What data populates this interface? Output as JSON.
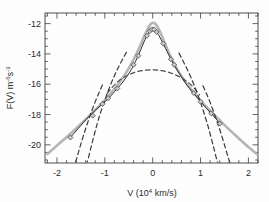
{
  "figure": {
    "name": "velocity-distribution-plot",
    "background_color": "#fdfdfd"
  },
  "chart_data": {
    "type": "line",
    "title": "",
    "xlabel": "V (10⁴ km/s)",
    "ylabel": "F(V) m⁻⁶s⁻³",
    "xlabel_parts": {
      "prefix": "V (10",
      "exponent": "4",
      "suffix": " km/s)"
    },
    "ylabel_parts": {
      "prefix": "F(V) m",
      "exp1": "-6",
      "mid": "s",
      "exp2": "-3"
    },
    "xlim": [
      -2.25,
      2.2
    ],
    "ylim": [
      -21.2,
      -11.3
    ],
    "xticks": [
      -2,
      -1,
      0,
      1,
      2
    ],
    "xtick_labels": [
      "-2",
      "-1",
      "0",
      "1",
      "2"
    ],
    "yticks": [
      -20,
      -18,
      -16,
      -14,
      -12
    ],
    "ytick_labels": [
      "-20",
      "-18",
      "-16",
      "-14",
      "-12"
    ],
    "x_minor_per_major": 5,
    "y_minor_per_major": 4,
    "grid": false,
    "legend": null,
    "frame": true,
    "ticks_inward": true,
    "series": [
      {
        "name": "model-fit-thick-gray",
        "style": "solid",
        "color": "#b5b5b5",
        "width": 2.6,
        "points": [
          [
            -2.2,
            -20.6
          ],
          [
            -2.0,
            -20.05
          ],
          [
            -1.8,
            -19.5
          ],
          [
            -1.6,
            -18.92
          ],
          [
            -1.4,
            -18.32
          ],
          [
            -1.2,
            -17.7
          ],
          [
            -1.0,
            -17.05
          ],
          [
            -0.85,
            -16.5
          ],
          [
            -0.7,
            -15.9
          ],
          [
            -0.6,
            -15.45
          ],
          [
            -0.5,
            -14.95
          ],
          [
            -0.42,
            -14.5
          ],
          [
            -0.34,
            -14.0
          ],
          [
            -0.26,
            -13.45
          ],
          [
            -0.2,
            -13.0
          ],
          [
            -0.14,
            -12.58
          ],
          [
            -0.09,
            -12.25
          ],
          [
            -0.05,
            -12.05
          ],
          [
            0.0,
            -11.95
          ],
          [
            0.05,
            -12.0
          ],
          [
            0.1,
            -12.2
          ],
          [
            0.15,
            -12.52
          ],
          [
            0.21,
            -12.95
          ],
          [
            0.27,
            -13.42
          ],
          [
            0.34,
            -13.95
          ],
          [
            0.42,
            -14.48
          ],
          [
            0.5,
            -14.95
          ],
          [
            0.6,
            -15.45
          ],
          [
            0.72,
            -16.0
          ],
          [
            0.86,
            -16.55
          ],
          [
            1.0,
            -17.08
          ],
          [
            1.2,
            -17.75
          ],
          [
            1.4,
            -18.38
          ],
          [
            1.6,
            -19.0
          ],
          [
            1.8,
            -19.58
          ],
          [
            2.0,
            -20.15
          ],
          [
            2.18,
            -20.62
          ]
        ]
      },
      {
        "name": "observed-data-black",
        "style": "solid",
        "color": "#2a2a2a",
        "width": 1.0,
        "points": [
          [
            -1.72,
            -19.52
          ],
          [
            -1.62,
            -19.15
          ],
          [
            -1.5,
            -18.72
          ],
          [
            -1.4,
            -18.35
          ],
          [
            -1.3,
            -18.05
          ],
          [
            -1.22,
            -17.78
          ],
          [
            -1.12,
            -17.5
          ],
          [
            -1.05,
            -17.3
          ],
          [
            -0.98,
            -17.1
          ],
          [
            -0.92,
            -16.92
          ],
          [
            -0.86,
            -16.72
          ],
          [
            -0.8,
            -16.5
          ],
          [
            -0.72,
            -16.22
          ],
          [
            -0.64,
            -15.92
          ],
          [
            -0.56,
            -15.58
          ],
          [
            -0.48,
            -15.2
          ],
          [
            -0.42,
            -14.88
          ],
          [
            -0.36,
            -14.5
          ],
          [
            -0.3,
            -14.1
          ],
          [
            -0.25,
            -13.72
          ],
          [
            -0.2,
            -13.35
          ],
          [
            -0.16,
            -13.05
          ],
          [
            -0.12,
            -12.8
          ],
          [
            -0.09,
            -12.62
          ],
          [
            -0.06,
            -12.48
          ],
          [
            -0.03,
            -12.38
          ],
          [
            0.0,
            -12.33
          ],
          [
            0.03,
            -12.36
          ],
          [
            0.06,
            -12.45
          ],
          [
            0.09,
            -12.58
          ],
          [
            0.13,
            -12.78
          ],
          [
            0.17,
            -13.02
          ],
          [
            0.22,
            -13.32
          ],
          [
            0.27,
            -13.65
          ],
          [
            0.33,
            -14.02
          ],
          [
            0.4,
            -14.45
          ],
          [
            0.48,
            -14.9
          ],
          [
            0.56,
            -15.32
          ],
          [
            0.64,
            -15.72
          ],
          [
            0.72,
            -16.08
          ],
          [
            0.82,
            -16.48
          ],
          [
            0.92,
            -16.85
          ],
          [
            1.02,
            -17.22
          ],
          [
            1.12,
            -17.58
          ],
          [
            1.22,
            -17.92
          ],
          [
            1.32,
            -18.28
          ],
          [
            1.42,
            -18.62
          ]
        ]
      },
      {
        "name": "gaussian-broad-dashed",
        "style": "dashed",
        "color": "#4a4a4a",
        "width": 1.2,
        "peak": [
          0.0,
          -15.05
        ],
        "points": [
          [
            -0.95,
            -16.6
          ],
          [
            -0.86,
            -16.25
          ],
          [
            -0.78,
            -15.98
          ],
          [
            -0.7,
            -15.75
          ],
          [
            -0.62,
            -15.58
          ],
          [
            -0.54,
            -15.44
          ],
          [
            -0.46,
            -15.32
          ],
          [
            -0.38,
            -15.22
          ],
          [
            -0.3,
            -15.15
          ],
          [
            -0.22,
            -15.1
          ],
          [
            -0.14,
            -15.07
          ],
          [
            -0.06,
            -15.05
          ],
          [
            0.02,
            -15.05
          ],
          [
            0.1,
            -15.07
          ],
          [
            0.18,
            -15.1
          ],
          [
            0.26,
            -15.15
          ],
          [
            0.34,
            -15.22
          ],
          [
            0.42,
            -15.31
          ],
          [
            0.5,
            -15.42
          ],
          [
            0.58,
            -15.55
          ],
          [
            0.66,
            -15.7
          ],
          [
            0.74,
            -15.88
          ],
          [
            0.82,
            -16.1
          ],
          [
            0.9,
            -16.38
          ],
          [
            0.98,
            -16.7
          ]
        ]
      },
      {
        "name": "gaussian-narrow-left-dashed",
        "style": "dashed",
        "color": "#3a3a3a",
        "width": 1.2,
        "points": [
          [
            -0.55,
            -13.9
          ],
          [
            -0.62,
            -14.3
          ],
          [
            -0.7,
            -14.78
          ],
          [
            -0.78,
            -15.3
          ],
          [
            -0.86,
            -15.88
          ],
          [
            -0.94,
            -16.52
          ],
          [
            -1.02,
            -17.22
          ],
          [
            -1.1,
            -17.98
          ],
          [
            -1.16,
            -18.62
          ],
          [
            -1.22,
            -19.32
          ],
          [
            -1.28,
            -20.05
          ],
          [
            -1.33,
            -20.7
          ],
          [
            -1.37,
            -21.15
          ]
        ]
      },
      {
        "name": "gaussian-narrow-left2-dashed",
        "style": "dashed",
        "color": "#3a3a3a",
        "width": 1.2,
        "points": [
          [
            -1.05,
            -16.05
          ],
          [
            -1.12,
            -16.55
          ],
          [
            -1.2,
            -17.15
          ],
          [
            -1.28,
            -17.82
          ],
          [
            -1.36,
            -18.55
          ],
          [
            -1.44,
            -19.32
          ],
          [
            -1.52,
            -20.15
          ],
          [
            -1.58,
            -20.82
          ],
          [
            -1.62,
            -21.2
          ]
        ]
      },
      {
        "name": "gaussian-narrow-right-dashed",
        "style": "dashed",
        "color": "#3a3a3a",
        "width": 1.2,
        "points": [
          [
            0.55,
            -13.95
          ],
          [
            0.62,
            -14.38
          ],
          [
            0.7,
            -14.88
          ],
          [
            0.78,
            -15.42
          ],
          [
            0.86,
            -16.02
          ],
          [
            0.94,
            -16.68
          ],
          [
            1.02,
            -17.4
          ],
          [
            1.1,
            -18.18
          ],
          [
            1.16,
            -18.82
          ],
          [
            1.22,
            -19.52
          ],
          [
            1.28,
            -20.25
          ],
          [
            1.33,
            -20.88
          ],
          [
            1.36,
            -21.2
          ]
        ]
      },
      {
        "name": "gaussian-narrow-right2-dashed",
        "style": "dashed",
        "color": "#3a3a3a",
        "width": 1.2,
        "points": [
          [
            1.05,
            -16.1
          ],
          [
            1.12,
            -16.6
          ],
          [
            1.2,
            -17.2
          ],
          [
            1.28,
            -17.88
          ],
          [
            1.36,
            -18.6
          ],
          [
            1.44,
            -19.38
          ],
          [
            1.52,
            -20.22
          ],
          [
            1.58,
            -20.88
          ],
          [
            1.62,
            -21.2
          ]
        ]
      }
    ],
    "markers": {
      "name": "data-point-markers",
      "shape": "diamond",
      "fill": "#c9c9c9",
      "stroke": "#4a4a4a",
      "size": 5.0,
      "points": [
        [
          -1.72,
          -19.52
        ],
        [
          -1.25,
          -18.08
        ],
        [
          -1.05,
          -17.3
        ],
        [
          -0.93,
          -16.92
        ],
        [
          -0.74,
          -16.28
        ],
        [
          -0.4,
          -14.72
        ],
        [
          -0.3,
          -14.12
        ],
        [
          -0.12,
          -12.8
        ],
        [
          -0.06,
          -12.5
        ],
        [
          -0.02,
          -12.38
        ],
        [
          0.03,
          -12.38
        ],
        [
          0.08,
          -12.55
        ],
        [
          0.22,
          -13.32
        ],
        [
          0.38,
          -14.35
        ],
        [
          0.45,
          -14.72
        ],
        [
          0.86,
          -16.58
        ],
        [
          1.0,
          -17.15
        ],
        [
          1.22,
          -17.92
        ],
        [
          1.4,
          -18.6
        ]
      ]
    }
  }
}
